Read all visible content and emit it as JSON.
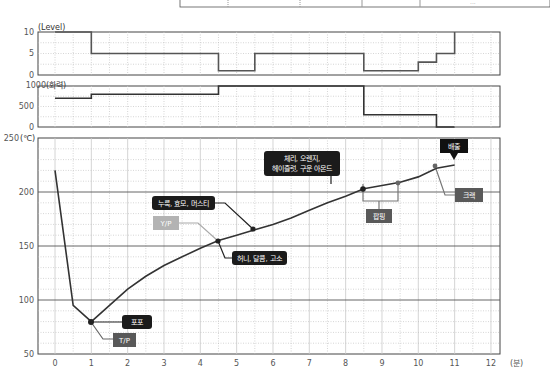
{
  "header_table": {
    "visible_cell_text": "..."
  },
  "chart_data": [
    {
      "type": "line",
      "name": "level-chart",
      "title": "",
      "ylabel": "(Level)",
      "xlabel": "",
      "xlim": [
        0,
        12.5
      ],
      "ylim": [
        0,
        10
      ],
      "yticks": [
        "0",
        "5",
        "10"
      ],
      "step": true,
      "x": [
        0,
        1,
        1,
        4.5,
        4.5,
        5.5,
        5.5,
        8.5,
        8.5,
        9.5,
        10,
        10,
        10.5,
        10.5,
        11,
        11
      ],
      "values": [
        10,
        10,
        5,
        5,
        1,
        1,
        5,
        5,
        1,
        1,
        1,
        3,
        3,
        5,
        5,
        10
      ],
      "grid": true
    },
    {
      "type": "line",
      "name": "heat-power-chart",
      "title": "",
      "ylabel": "(화력)",
      "xlabel": "",
      "xlim": [
        0,
        12.5
      ],
      "ylim": [
        0,
        1000
      ],
      "yticks": [
        "0",
        "500",
        "1000"
      ],
      "step": true,
      "x": [
        0,
        1,
        1,
        4.5,
        4.5,
        8.5,
        8.5,
        10.5,
        10.5,
        11
      ],
      "values": [
        700,
        700,
        800,
        800,
        1000,
        1000,
        300,
        300,
        0,
        0
      ],
      "grid": true
    },
    {
      "type": "line",
      "name": "temperature-chart",
      "title": "",
      "ylabel": "(℃)",
      "xlabel": "(분)",
      "xlim": [
        0,
        12.5
      ],
      "ylim": [
        50,
        250
      ],
      "yticks": [
        "50",
        "100",
        "150",
        "200",
        "250"
      ],
      "xticks": [
        "0",
        "1",
        "2",
        "3",
        "4",
        "5",
        "6",
        "7",
        "8",
        "9",
        "10",
        "11",
        "12"
      ],
      "x": [
        0,
        0.5,
        1,
        1.5,
        2,
        2.5,
        3,
        3.5,
        4,
        4.5,
        5,
        5.5,
        6,
        6.5,
        7,
        7.5,
        8,
        8.5,
        9,
        9.5,
        10,
        10.5,
        11
      ],
      "values": [
        220,
        95,
        80,
        95,
        110,
        122,
        132,
        140,
        148,
        155,
        160,
        165,
        170,
        176,
        183,
        190,
        196,
        203,
        206,
        209,
        214,
        222,
        225
      ],
      "grid": true,
      "annotations": [
        {
          "label": "T/P",
          "x": 1,
          "y": 80,
          "style": "gray-box"
        },
        {
          "label": "포포",
          "x": 1,
          "y": 80,
          "style": "black-box"
        },
        {
          "label": "Y/P",
          "x": 4.5,
          "y": 155,
          "style": "light-gray-box"
        },
        {
          "label": "허니, 달콤, 고소",
          "x": 4.5,
          "y": 155,
          "style": "black-box"
        },
        {
          "label": "누룩, 효모, 머스티",
          "x": 5.5,
          "y": 165,
          "style": "black-box"
        },
        {
          "label": "체리, 오렌지, 헤이즐럿, 구운 아몬드",
          "x": 8.5,
          "y": 203,
          "style": "black-box"
        },
        {
          "label": "팝핑",
          "x": 9,
          "y": 205,
          "style": "gray-box"
        },
        {
          "label": "크랙",
          "x": 10.5,
          "y": 222,
          "style": "gray-box"
        },
        {
          "label": "배출",
          "x": 11,
          "y": 225,
          "style": "black-box"
        }
      ]
    }
  ],
  "labels": {
    "level_unit": "(Level)",
    "heat_unit": "(화력)",
    "temp_unit": "(℃)",
    "time_unit": "(분)",
    "tp": "T/P",
    "popo": "포포",
    "yp": "Y/P",
    "honey": "허니, 달콤, 고소",
    "yeast": "누룩, 효모, 머스티",
    "cherry_l1": "체리, 오렌지,",
    "cherry_l2": "헤이즐럿, 구운 아몬드",
    "popping": "팝핑",
    "crack": "크랙",
    "discharge": "배출"
  },
  "axes": {
    "level_ticks": [
      "10",
      "5",
      "0"
    ],
    "heat_ticks": [
      "1000",
      "500",
      "0"
    ],
    "temp_ticks": [
      "250",
      "200",
      "150",
      "100",
      "50"
    ],
    "time_ticks": [
      "0",
      "1",
      "2",
      "3",
      "4",
      "5",
      "6",
      "7",
      "8",
      "9",
      "10",
      "11",
      "12"
    ]
  }
}
